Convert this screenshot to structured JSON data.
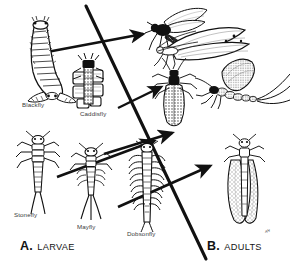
{
  "figure": {
    "background_color": "#ffffff",
    "ink_color": "#1a1a1a",
    "divider": {
      "name": "diagonal-divider-line",
      "from": [
        86,
        6
      ],
      "to": [
        206,
        259
      ]
    }
  },
  "sections": [
    {
      "id": "larvae",
      "letter": "A.",
      "word": "LARVAE",
      "x": 20,
      "y": 238
    },
    {
      "id": "adults",
      "letter": "B.",
      "word": "ADULTS",
      "x": 207,
      "y": 238
    }
  ],
  "marks": {
    "corner_artifact": "ᴀᴴ"
  },
  "larvae": [
    {
      "name": "blackfly",
      "label": "Blackfly",
      "label_x": 22,
      "label_y": 106
    },
    {
      "name": "caddisfly",
      "label": "Caddisfly",
      "label_x": 82,
      "label_y": 113
    },
    {
      "name": "stonefly",
      "label": "Stonefly",
      "label_x": 14,
      "label_y": 215
    },
    {
      "name": "mayfly",
      "label": "Mayfly",
      "label_x": 76,
      "label_y": 227
    },
    {
      "name": "dobsonfly",
      "label": "Dobsonfly",
      "label_x": 128,
      "label_y": 234
    }
  ],
  "adults": [
    {
      "name": "blackfly-adult"
    },
    {
      "name": "caddisfly-adult-upper"
    },
    {
      "name": "caddisfly-adult"
    },
    {
      "name": "mayfly-adult"
    },
    {
      "name": "dobsonfly-adult"
    }
  ],
  "arrows": [
    {
      "name": "arrow-blackfly-to-adult",
      "from": [
        47,
        52
      ],
      "to": [
        145,
        35
      ]
    },
    {
      "name": "arrow-caddisfly-to-adult",
      "from": [
        118,
        107
      ],
      "to": [
        163,
        87
      ]
    },
    {
      "name": "arrow-stonefly-to-adult",
      "from": [
        108,
        152
      ],
      "to": [
        175,
        133
      ]
    },
    {
      "name": "arrow-mayfly-to-adult",
      "from": [
        57,
        175
      ],
      "to": [
        157,
        140
      ]
    },
    {
      "name": "arrow-dobsonfly-to-adult",
      "from": [
        118,
        205
      ],
      "to": [
        213,
        164
      ]
    }
  ]
}
